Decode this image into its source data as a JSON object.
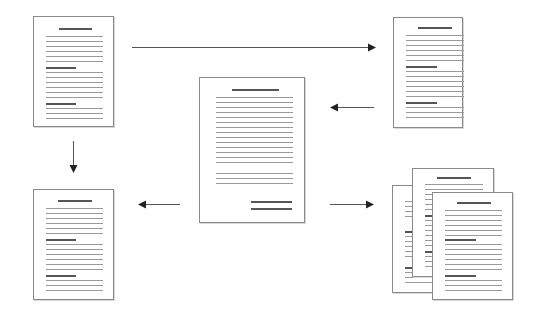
{
  "diagram": {
    "title": "",
    "colors": {
      "page_border": "#8a8a8a",
      "text_line": "#9a9a9a",
      "heading_line": "#555555",
      "arrow": "#333333"
    },
    "nodes": [
      {
        "id": "doc-top-left",
        "type": "document-with-sections",
        "label": ""
      },
      {
        "id": "doc-top-right",
        "type": "document-with-sections",
        "label": ""
      },
      {
        "id": "doc-center",
        "type": "letter-document",
        "label": ""
      },
      {
        "id": "doc-bottom-left",
        "type": "document-with-sections",
        "label": ""
      },
      {
        "id": "doc-stack-bottom-right",
        "type": "stack-of-documents",
        "count": 3,
        "label": ""
      }
    ],
    "edges": [
      {
        "from": "doc-top-left",
        "to": "doc-top-right",
        "direction": "right"
      },
      {
        "from": "doc-top-right",
        "to": "doc-center",
        "direction": "left"
      },
      {
        "from": "doc-top-left",
        "to": "doc-bottom-left",
        "direction": "down"
      },
      {
        "from": "doc-center",
        "to": "doc-bottom-left",
        "direction": "left"
      },
      {
        "from": "doc-center",
        "to": "doc-stack-bottom-right",
        "direction": "right"
      }
    ]
  }
}
